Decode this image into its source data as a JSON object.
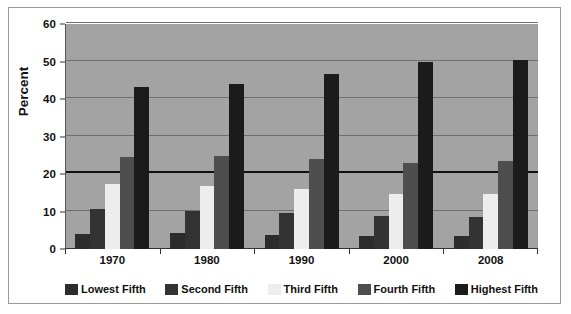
{
  "chart_data": {
    "type": "bar",
    "title": "",
    "subtitle": "",
    "xlabel": "",
    "ylabel": "Percent",
    "categories": [
      "1970",
      "1980",
      "1990",
      "2000",
      "2008"
    ],
    "series": [
      {
        "name": "Lowest Fifth",
        "color": "#2c2c2c",
        "values": [
          4.1,
          4.2,
          3.8,
          3.6,
          3.4
        ]
      },
      {
        "name": "Second Fifth",
        "color": "#333333",
        "values": [
          10.8,
          10.2,
          9.6,
          8.9,
          8.6
        ]
      },
      {
        "name": "Third Fifth",
        "color": "#ededed",
        "values": [
          17.4,
          16.8,
          15.9,
          14.8,
          14.7
        ]
      },
      {
        "name": "Fourth Fifth",
        "color": "#4e4e4e",
        "values": [
          24.5,
          24.7,
          24.0,
          23.0,
          23.6
        ]
      },
      {
        "name": "Highest Fifth",
        "color": "#1b1b1b",
        "values": [
          43.3,
          44.1,
          46.6,
          49.8,
          50.3
        ]
      }
    ],
    "ylim": [
      0,
      60
    ],
    "y_ticks": [
      0,
      10,
      20,
      30,
      40,
      50,
      60
    ],
    "y_tick_labels": [
      "0",
      "10",
      "20",
      "30",
      "40",
      "50",
      "60"
    ],
    "emphasized_gridline": 20,
    "grid": true,
    "grid_orientation": "horizontal",
    "legend_position": "bottom",
    "plot_background": "#a3a3a3",
    "figure_background": "#ffffff",
    "gridline_color": "#6f6f6f",
    "axis_color": "#333333",
    "bar_gap_within_group": 0,
    "group_padding_fraction": 0.22
  }
}
